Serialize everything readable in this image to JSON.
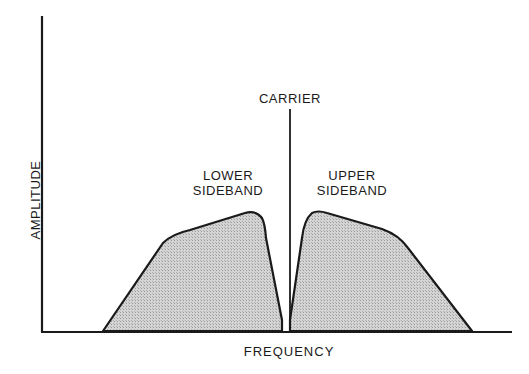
{
  "diagram": {
    "labels": {
      "carrier": "CARRIER",
      "lower_line1": "LOWER",
      "lower_line2": "SIDEBAND",
      "upper_line1": "UPPER",
      "upper_line2": "SIDEBAND",
      "x_axis": "FREQUENCY",
      "y_axis": "AMPLITUDE"
    },
    "colors": {
      "line": "#1a1a1a",
      "fill": "#c8c8c8",
      "background": "#ffffff"
    }
  }
}
